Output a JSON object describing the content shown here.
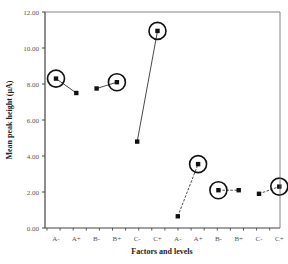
{
  "chart_data": {
    "type": "scatter",
    "title": "",
    "xlabel": "Factors and levels",
    "ylabel": "Mean peak height (µA)",
    "ylim": [
      0,
      12
    ],
    "yticks": [
      "0.00",
      "2.00",
      "4.00",
      "6.00",
      "8.00",
      "10.00",
      "12.00"
    ],
    "grid": false,
    "legend": null,
    "categories": [
      "A-",
      "A+",
      "B-",
      "B+",
      "C-",
      "C+",
      "A-",
      "A+",
      "B-",
      "B+",
      "C-",
      "C+"
    ],
    "series": [
      {
        "name": "group-1",
        "line": "solid",
        "points": [
          {
            "x": "A-",
            "y": 8.3,
            "circled": true
          },
          {
            "x": "A+",
            "y": 7.5,
            "circled": false
          }
        ]
      },
      {
        "name": "group-2",
        "line": "solid",
        "points": [
          {
            "x": "B-",
            "y": 7.75,
            "circled": false
          },
          {
            "x": "B+",
            "y": 8.1,
            "circled": true
          }
        ]
      },
      {
        "name": "group-3",
        "line": "solid",
        "points": [
          {
            "x": "C-",
            "y": 4.8,
            "circled": false
          },
          {
            "x": "C+",
            "y": 10.95,
            "circled": true
          }
        ]
      },
      {
        "name": "group-4",
        "line": "dashed",
        "points": [
          {
            "x": "A-",
            "y": 0.65,
            "circled": false
          },
          {
            "x": "A+",
            "y": 3.55,
            "circled": true
          }
        ]
      },
      {
        "name": "group-5",
        "line": "dashed",
        "points": [
          {
            "x": "B-",
            "y": 2.1,
            "circled": true
          },
          {
            "x": "B+",
            "y": 2.1,
            "circled": false
          }
        ]
      },
      {
        "name": "group-6",
        "line": "dashed",
        "points": [
          {
            "x": "C-",
            "y": 1.9,
            "circled": false
          },
          {
            "x": "C+",
            "y": 2.3,
            "circled": true
          }
        ]
      }
    ]
  }
}
